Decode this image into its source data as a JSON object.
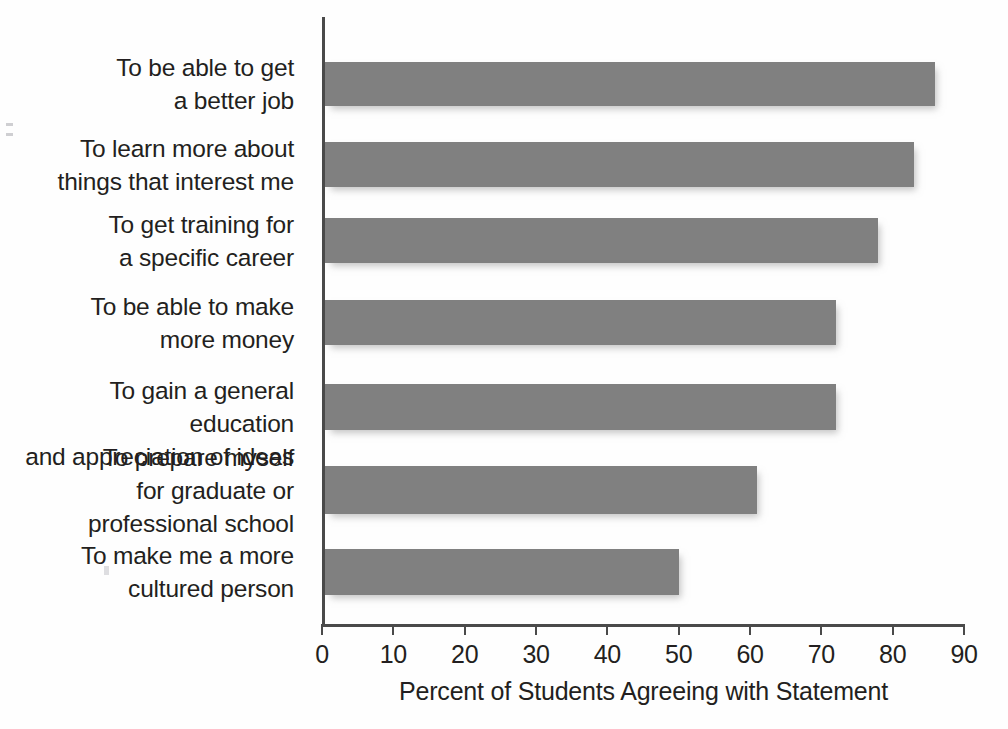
{
  "chart_data": {
    "type": "bar",
    "orientation": "horizontal",
    "title": "",
    "xlabel": "Percent of Students Agreeing with Statement",
    "ylabel": "",
    "xlim": [
      0,
      90
    ],
    "grid": false,
    "legend": null,
    "bar_color": "#808080",
    "axis_color": "#4a4a4a",
    "xticks": [
      0,
      10,
      20,
      30,
      40,
      50,
      60,
      70,
      80,
      90
    ],
    "xtick_labels": [
      "0",
      "10",
      "20",
      "30",
      "40",
      "50",
      "60",
      "70",
      "80",
      "90"
    ],
    "categories": [
      "To be able to get\na better job",
      "To learn more about\nthings that interest me",
      "To get training for\na specific career",
      "To be able to make\nmore money",
      "To gain a general education\nand appreciation of ideas",
      "To prepare myself\nfor graduate or\nprofessional school",
      "To make me a more\ncultured person"
    ],
    "values": [
      86,
      83,
      78,
      72,
      72,
      61,
      50
    ]
  },
  "axis": {
    "x_title": "Percent of Students Agreeing with Statement"
  }
}
